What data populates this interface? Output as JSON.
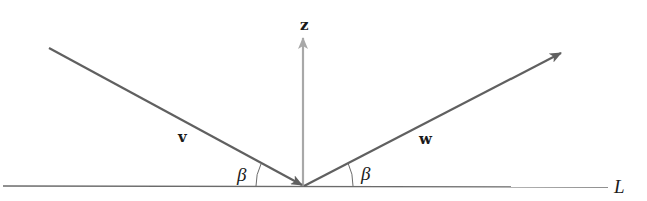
{
  "diagram": {
    "colors": {
      "line": "#6b6b6b",
      "vector": "#606060",
      "normal": "#a8a8a8",
      "text": "#1a1a1a",
      "background": "#ffffff"
    },
    "line": {
      "label": "L"
    },
    "vectors": [
      {
        "id": "v",
        "label": "v",
        "direction": "incoming toward origin"
      },
      {
        "id": "z",
        "label": "z",
        "direction": "vertical normal"
      },
      {
        "id": "w",
        "label": "w",
        "direction": "outgoing from origin"
      }
    ],
    "angles": [
      {
        "label": "β",
        "between": "v and L"
      },
      {
        "label": "β",
        "between": "w and L"
      }
    ]
  }
}
